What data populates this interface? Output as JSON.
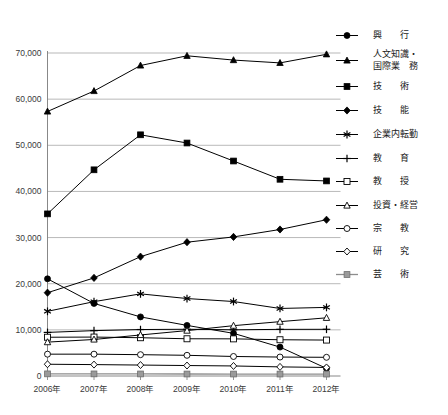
{
  "chart_data": {
    "type": "line",
    "title": "",
    "subtitle": "",
    "xlabel": "",
    "ylabel": "",
    "xlim": [
      2006,
      2012
    ],
    "ylim": [
      0,
      70000
    ],
    "grid": true,
    "legend_position": "right",
    "categories": [
      "2006年",
      "2007年",
      "2008年",
      "2009年",
      "2010年",
      "2011年",
      "2012年"
    ],
    "x": [
      2006,
      2007,
      2008,
      2009,
      2010,
      2011,
      2012
    ],
    "y_ticks": [
      0,
      10000,
      20000,
      30000,
      40000,
      50000,
      60000,
      70000
    ],
    "y_tick_labels": [
      "0",
      "10,000",
      "20,000",
      "30,000",
      "40,000",
      "50,000",
      "60,000",
      "70,000"
    ],
    "series": [
      {
        "name": "興　　行",
        "legend_label": "興　　行",
        "marker": "circle-filled",
        "color": "#000000",
        "values": [
          21062,
          15728,
          12808,
          10966,
          9247,
          6265,
          1646
        ]
      },
      {
        "name": "人文知識・国際業務",
        "legend_label": "人文知識・\n国際業務",
        "legend_label_line1": "人文知識・",
        "legend_label_line2": "国際業　務",
        "marker": "triangle-filled",
        "color": "#000000",
        "values": [
          57323,
          61763,
          67291,
          69395,
          68467,
          67854,
          69721
        ]
      },
      {
        "name": "技　　術",
        "legend_label": "技　　術",
        "marker": "square-filled",
        "color": "#000000",
        "values": [
          35135,
          44684,
          52273,
          50493,
          46592,
          42634,
          42273
        ]
      },
      {
        "name": "技　　能",
        "legend_label": "技　　能",
        "marker": "diamond-filled",
        "color": "#000000",
        "values": [
          18051,
          21261,
          25863,
          28995,
          30142,
          31751,
          33863
        ]
      },
      {
        "name": "企業内転勤",
        "legend_label": "企業内転勤",
        "marker": "asterisk",
        "color": "#000000",
        "values": [
          14014,
          16111,
          17798,
          16786,
          16140,
          14636,
          14867
        ]
      },
      {
        "name": "教　　育",
        "legend_label": "教　　育",
        "marker": "plus",
        "color": "#000000",
        "values": [
          9449,
          9832,
          10070,
          10129,
          10012,
          10106,
          10121
        ]
      },
      {
        "name": "教　　授",
        "legend_label": "教　　授",
        "marker": "square-open",
        "color": "#000000",
        "values": [
          8399,
          8436,
          8295,
          8068,
          8050,
          7859,
          7787
        ]
      },
      {
        "name": "投資・経営",
        "legend_label": "投資・経営",
        "marker": "triangle-open",
        "color": "#000000",
        "values": [
          7342,
          7916,
          8895,
          9840,
          10908,
          11778,
          12609
        ]
      },
      {
        "name": "宗　　教",
        "legend_label": "宗　　教",
        "marker": "circle-open",
        "color": "#000000",
        "values": [
          4732,
          4732,
          4620,
          4484,
          4232,
          4106,
          4051
        ]
      },
      {
        "name": "研　　究",
        "legend_label": "研　　究",
        "marker": "diamond-open",
        "color": "#000000",
        "values": [
          2548,
          2469,
          2373,
          2266,
          2176,
          1974,
          1854
        ]
      },
      {
        "name": "芸　　術",
        "legend_label": "芸　　術",
        "marker": "square-gray",
        "color": "#9a9a9a",
        "values": [
          462,
          455,
          443,
          432,
          425,
          420,
          415
        ]
      }
    ]
  }
}
